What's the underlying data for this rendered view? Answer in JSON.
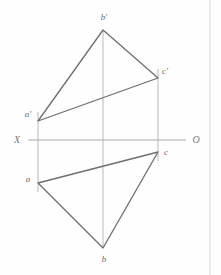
{
  "diagram": {
    "canvas": {
      "width": 221,
      "height": 275,
      "background": "#fefefe"
    },
    "colors": {
      "triangle_stroke": "#6e6e6e",
      "projector_stroke": "#b9b9b9",
      "axis_stroke": "#a8a8a8",
      "border_stroke": "#d8d8d8",
      "label_fill": "#6b6b6b",
      "axis_label_fill": "#7a7a7a"
    },
    "axis": {
      "name": "ground-line",
      "y": 140,
      "x_start": 28,
      "x_end": 186,
      "left_label": "X",
      "right_label": "O",
      "left_label_x": 17,
      "left_label_y": 143,
      "right_label_x": 196,
      "right_label_y": 143
    },
    "frontal_view": {
      "name": "frontal-projection",
      "vertices": [
        {
          "id": "a-prime",
          "label": "a'",
          "x": 38,
          "y": 121,
          "label_x": 28,
          "label_y": 117
        },
        {
          "id": "b-prime",
          "label": "b'",
          "x": 103,
          "y": 30,
          "label_x": 104,
          "label_y": 20
        },
        {
          "id": "c-prime",
          "label": "c'",
          "x": 158,
          "y": 78,
          "label_x": 165,
          "label_y": 74
        }
      ]
    },
    "horizontal_view": {
      "name": "horizontal-projection",
      "vertices": [
        {
          "id": "a",
          "label": "a",
          "x": 38,
          "y": 183,
          "label_x": 28,
          "label_y": 182
        },
        {
          "id": "b",
          "label": "b",
          "x": 103,
          "y": 248,
          "label_x": 104,
          "label_y": 262
        },
        {
          "id": "c",
          "label": "c",
          "x": 158,
          "y": 152,
          "label_x": 166,
          "label_y": 155
        }
      ]
    },
    "projectors": [
      {
        "id": "projector-a",
        "x": 38,
        "y1": 112,
        "y2": 192
      },
      {
        "id": "projector-b",
        "x": 103,
        "y1": 30,
        "y2": 248
      },
      {
        "id": "projector-c",
        "x": 158,
        "y1": 69,
        "y2": 161
      }
    ],
    "border": {
      "x": 210,
      "y1": 0,
      "y2": 275
    }
  }
}
